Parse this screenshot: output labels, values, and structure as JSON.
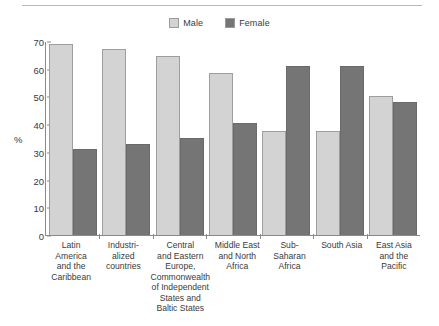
{
  "legend": {
    "items": [
      {
        "label": "Male",
        "color": "#d3d3d3",
        "icon": "square-swatch-icon"
      },
      {
        "label": "Female",
        "color": "#757575",
        "icon": "square-swatch-icon"
      }
    ]
  },
  "chart_data": {
    "type": "bar",
    "title": "",
    "xlabel": "",
    "ylabel": "%",
    "ylim": [
      0,
      70
    ],
    "yticks": [
      0,
      10,
      20,
      30,
      40,
      50,
      60,
      70
    ],
    "grid": false,
    "legend_position": "top-center",
    "categories": [
      "Latin America\nand the\nCaribbean",
      "Industri-\nalized\ncountries",
      "Central\nand Eastern\nEurope,\nCommonwealth\nof Independent\nStates and\nBaltic States",
      "Middle East\nand North\nAfrica",
      "Sub-Saharan\nAfrica",
      "South Asia",
      "East Asia\nand the\nPacific"
    ],
    "series": [
      {
        "name": "Male",
        "color": "#d3d3d3",
        "values": [
          69,
          67,
          64.5,
          58.5,
          37.5,
          37.5,
          50
        ]
      },
      {
        "name": "Female",
        "color": "#757575",
        "values": [
          31,
          33,
          35,
          40.5,
          61,
          61,
          48
        ]
      }
    ]
  }
}
